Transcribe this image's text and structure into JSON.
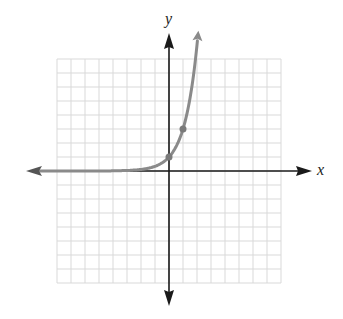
{
  "chart_data": {
    "type": "line",
    "title": "",
    "function": "y = 3^x",
    "xlabel": "x",
    "ylabel": "y",
    "xlim": [
      -8,
      8
    ],
    "ylim": [
      -8,
      8
    ],
    "grid": true,
    "grid_step": 1,
    "legend": null,
    "series": [
      {
        "name": "exponential curve",
        "x": [
          -8,
          -6,
          -4,
          -3,
          -2,
          -1,
          -0.5,
          0,
          0.5,
          1,
          1.5,
          2,
          2.1
        ],
        "y": [
          0.0002,
          0.0014,
          0.012,
          0.037,
          0.111,
          0.333,
          0.577,
          1,
          1.732,
          3,
          5.196,
          9,
          10.0
        ],
        "color": "#8a8a8a",
        "arrows": [
          "left",
          "up"
        ]
      }
    ],
    "marked_points": [
      {
        "x": 0,
        "y": 1
      },
      {
        "x": 1,
        "y": 3
      }
    ],
    "asymptote": "y = 0"
  },
  "labels": {
    "x_axis": "x",
    "y_axis": "y"
  },
  "colors": {
    "axis": "#1a1a1a",
    "grid": "#d9d9d9",
    "curve": "#8a8a8a",
    "point": "#7a7a7a"
  }
}
